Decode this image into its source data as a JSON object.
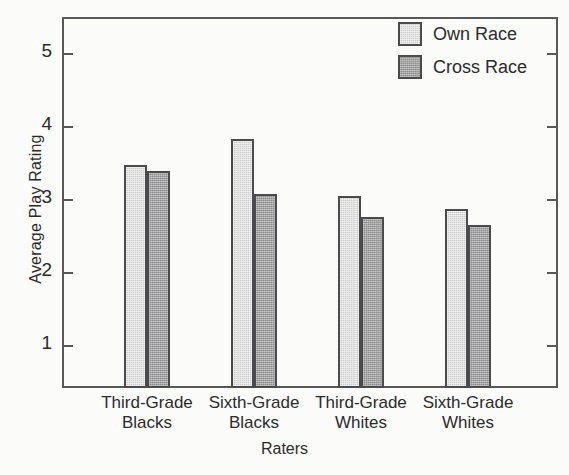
{
  "chart_data": {
    "type": "bar",
    "title": "",
    "xlabel": "Raters",
    "ylabel": "Average Play Rating",
    "categories": [
      "Third-Grade Blacks",
      "Sixth-Grade Blacks",
      "Third-Grade Whites",
      "Sixth-Grade Whites"
    ],
    "category_lines": [
      [
        "Third-Grade",
        "Blacks"
      ],
      [
        "Sixth-Grade",
        "Blacks"
      ],
      [
        "Third-Grade",
        "Whites"
      ],
      [
        "Sixth-Grade",
        "Whites"
      ]
    ],
    "series": [
      {
        "name": "Own Race",
        "color": "#cbcbcb",
        "values": [
          3.47,
          3.82,
          3.04,
          2.86
        ]
      },
      {
        "name": "Cross Race",
        "color": "#8d8d8d",
        "values": [
          3.38,
          3.07,
          2.76,
          2.64
        ]
      }
    ],
    "ylim": [
      0.55,
      5.45
    ],
    "yticks": [
      1,
      2,
      3,
      4,
      5
    ],
    "ytick_labels": [
      "1",
      "2",
      "3",
      "4",
      "5"
    ],
    "grid": false,
    "legend_position": "top-right",
    "axis_color": "#58585a",
    "bar_edge_color": "#4b4b4d",
    "background_color": "#fbfbfa"
  },
  "legend": {
    "items": [
      {
        "label": "Own Race"
      },
      {
        "label": "Cross Race"
      }
    ]
  }
}
